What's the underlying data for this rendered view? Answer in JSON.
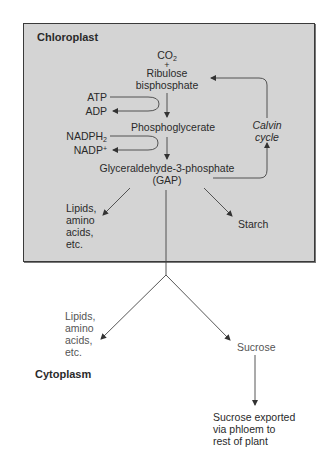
{
  "compartments": {
    "chloroplast": "Chloroplast",
    "cytoplasm": "Cytoplasm"
  },
  "calvin": {
    "co2": "CO",
    "co2_sub": "2",
    "plus": "+",
    "rubp_line1": "Ribulose",
    "rubp_line2": "bisphosphate",
    "atp": "ATP",
    "adp": "ADP",
    "phosphoglycerate": "Phosphoglycerate",
    "nadph": "NADPH",
    "nadph_sub": "2",
    "nadp": "NADP",
    "nadp_sup": "+",
    "gap_line1": "Glyceraldehyde-3-phosphate",
    "gap_line2": "(GAP)",
    "cycle_line1": "Calvin",
    "cycle_line2": "cycle"
  },
  "chloroplast_products": {
    "lipids": [
      "Lipids,",
      "amino",
      "acids,",
      "etc."
    ],
    "starch": "Starch"
  },
  "cytoplasm_products": {
    "lipids": [
      "Lipids,",
      "amino",
      "acids,",
      "etc."
    ],
    "sucrose": "Sucrose",
    "export": [
      "Sucrose exported",
      "via  phloem to",
      "rest of plant"
    ]
  },
  "colors": {
    "chloroplast_fill": "#d4d4d4",
    "border": "#3a3a3a",
    "arrow": "#333333"
  }
}
